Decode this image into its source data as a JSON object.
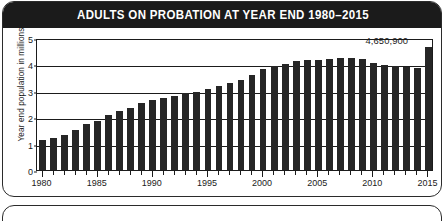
{
  "header": {
    "title": "ADULTS ON PROBATION AT YEAR END 1980–2015"
  },
  "colors": {
    "title_bar": "#1b1b1b",
    "title_text": "#ffffff",
    "bar": "#262626",
    "axis": "#1b1b1b",
    "card_background": "#ffffff",
    "card_border": "#2b2b2b"
  },
  "annotation": {
    "value_label": "4,650,900"
  },
  "chart_data": {
    "type": "bar",
    "title": "ADULTS ON PROBATION AT YEAR END 1980–2015",
    "xlabel": "",
    "ylabel": "Year end population in millions",
    "ylim": [
      0,
      5
    ],
    "yticks": [
      0,
      1,
      2,
      3,
      4,
      5
    ],
    "ytick_labels": [
      "0",
      "1",
      "2",
      "3",
      "4",
      "5"
    ],
    "xtick_labels": [
      "1980",
      "1985",
      "1990",
      "1995",
      "2000",
      "2005",
      "2010",
      "2015"
    ],
    "grid": true,
    "legend": false,
    "annotations": [
      {
        "text": "4,650,900",
        "year": 2015,
        "value": 4.65
      }
    ],
    "categories": [
      "1980",
      "1981",
      "1982",
      "1983",
      "1984",
      "1985",
      "1986",
      "1987",
      "1988",
      "1989",
      "1990",
      "1991",
      "1992",
      "1993",
      "1994",
      "1995",
      "1996",
      "1997",
      "1998",
      "1999",
      "2000",
      "2001",
      "2002",
      "2003",
      "2004",
      "2005",
      "2006",
      "2007",
      "2008",
      "2009",
      "2010",
      "2011",
      "2012",
      "2013",
      "2014",
      "2015"
    ],
    "values": [
      1.12,
      1.23,
      1.34,
      1.52,
      1.74,
      1.87,
      2.09,
      2.25,
      2.36,
      2.52,
      2.67,
      2.73,
      2.81,
      2.9,
      2.96,
      3.08,
      3.17,
      3.3,
      3.42,
      3.6,
      3.84,
      3.93,
      4.02,
      4.12,
      4.15,
      4.17,
      4.22,
      4.23,
      4.24,
      4.2,
      4.06,
      3.98,
      3.94,
      3.9,
      3.86,
      4.65
    ]
  }
}
